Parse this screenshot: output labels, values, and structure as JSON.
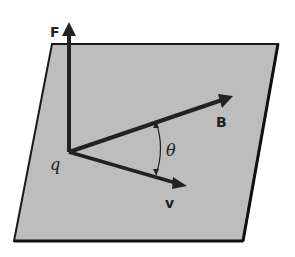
{
  "figure": {
    "labels": {
      "force": "F",
      "field": "B",
      "velocity": "v",
      "charge": "q",
      "angle": "θ"
    },
    "colors": {
      "plane_fill": "#bdbdbd",
      "plane_edge": "#1a1a1a",
      "vectors": "#222222"
    }
  }
}
